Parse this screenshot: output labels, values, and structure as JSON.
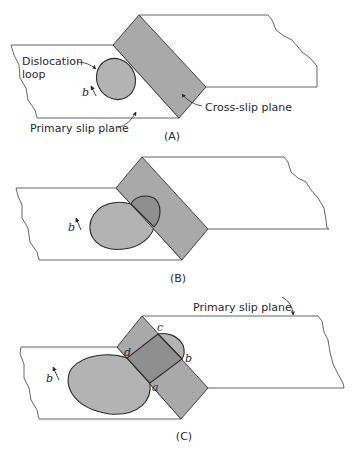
{
  "diagram": {
    "panels": [
      {
        "id": "A",
        "caption": "(A)",
        "labels": {
          "dislocation_loop_line1": "Dislocation",
          "dislocation_loop_line2": "loop",
          "burgers_vector": "b",
          "cross_slip_plane": "Cross-slip plane",
          "primary_slip_plane": "Primary slip plane"
        }
      },
      {
        "id": "B",
        "caption": "(B)",
        "labels": {
          "burgers_vector": "b"
        }
      },
      {
        "id": "C",
        "caption": "(C)",
        "labels": {
          "primary_slip_plane": "Primary slip plane",
          "burgers_vector": "b",
          "point_a": "a",
          "point_b": "b",
          "point_c": "c",
          "point_d": "d"
        }
      }
    ],
    "colors": {
      "cross_slip_fill": "#a9a9a9",
      "loop_fill": "#b3b3b3",
      "overlap_fill": "#8f8f8f",
      "outline": "#2b2b2b",
      "plane_edge": "#555555"
    }
  }
}
